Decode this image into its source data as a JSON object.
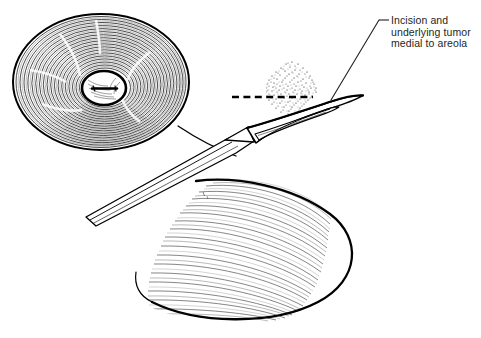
{
  "figure": {
    "title": "Incision and underlying tumor medial to areola",
    "background_color": "#ffffff",
    "ink_color": "#000000",
    "text_color": "#231f20"
  },
  "annotations": [
    {
      "id": "tumor-incision",
      "lines": [
        "Incision and",
        "underlying tumor",
        "medial to areola"
      ],
      "leader": {
        "dash_x1": 379,
        "dash_y1": 20,
        "dash_x2": 389,
        "dash_y2": 20,
        "line_x1": 379,
        "line_y1": 20,
        "line_x2": 331,
        "line_y2": 100
      }
    }
  ],
  "structures": {
    "areola": {
      "name": "areola-top-view",
      "center_x": 101,
      "center_y": 82,
      "radius_x": 89,
      "radius_y": 69,
      "ring_count": 26
    },
    "nipple": {
      "name": "nipple",
      "center_x": 104,
      "center_y": 88,
      "radius_x": 22,
      "radius_y": 17,
      "slit_label": "nipple-orifice"
    },
    "tumor": {
      "name": "underlying-tumor-stipple",
      "center_x": 292,
      "center_y": 90,
      "radius_x": 26,
      "radius_y": 32,
      "dot_count": 520
    },
    "incision_line": {
      "name": "dashed-incision-line",
      "x1": 232,
      "y1": 97,
      "x2": 312,
      "y2": 97,
      "dash_pattern": "7,4"
    },
    "scalpel": {
      "name": "scalpel",
      "handle_tip_x": 86,
      "handle_tip_y": 217,
      "blade_tip_x": 362,
      "blade_tip_y": 96
    },
    "breast_contour": {
      "name": "breast-lower-contour",
      "hatch_line_count": 30
    }
  }
}
